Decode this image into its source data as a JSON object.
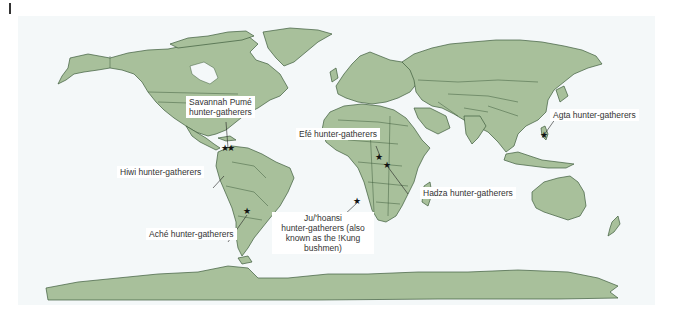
{
  "figure": {
    "colors": {
      "land": "#a8c09b",
      "border": "#3e5c3c",
      "ocean": "#f4f8f9",
      "marker": "#111111",
      "label_bg": "#ffffff",
      "label_text": "#333333"
    }
  },
  "labels": [
    {
      "id": "savannah-pume",
      "text": "Savannah Pumé hunter-gatherers",
      "line1": "Savannah Pumé",
      "line2": "hunter-gatherers",
      "marker": "star",
      "region": "Venezuela"
    },
    {
      "id": "hiwi",
      "text": "Hiwi hunter-gatherers",
      "marker": "star",
      "region": "Venezuela"
    },
    {
      "id": "ache",
      "text": "Aché hunter-gatherers",
      "marker": "star",
      "region": "Paraguay"
    },
    {
      "id": "efe",
      "text": "Efé hunter-gatherers",
      "marker": "star",
      "region": "DR Congo"
    },
    {
      "id": "hadza",
      "text": "Hadza hunter-gatherers",
      "marker": "star",
      "region": "Tanzania"
    },
    {
      "id": "juhoansi",
      "text": "Ju/'hoansi hunter-gatherers (also known as the !Kung bushmen)",
      "line1": "Ju/'hoansi",
      "line2": "hunter-gatherers (also",
      "line3": "known as the !Kung",
      "line4": "bushmen)",
      "marker": "star",
      "region": "Namibia/Botswana"
    },
    {
      "id": "agta",
      "text": "Agta hunter-gatherers",
      "marker": "star",
      "region": "Philippines"
    }
  ],
  "markers": {
    "count": 7,
    "glyph": "★"
  }
}
